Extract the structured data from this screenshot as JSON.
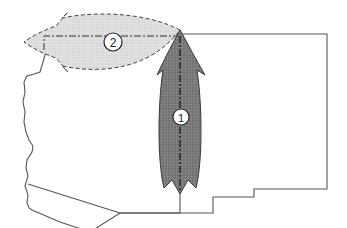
{
  "diagram": {
    "type": "map-arrows",
    "arrows": [
      {
        "id": "arrow-1",
        "label": "1",
        "direction": "north",
        "style": "solid-dark",
        "fill": "#7a7a7a"
      },
      {
        "id": "arrow-2",
        "label": "2",
        "direction": "west",
        "style": "dashed-light",
        "fill": "#d8d8d8"
      }
    ],
    "colors": {
      "outline": "#555555",
      "arrow1_fill": "#7a7a7a",
      "arrow2_fill": "#dcdcdc",
      "dashline": "#333333"
    }
  }
}
